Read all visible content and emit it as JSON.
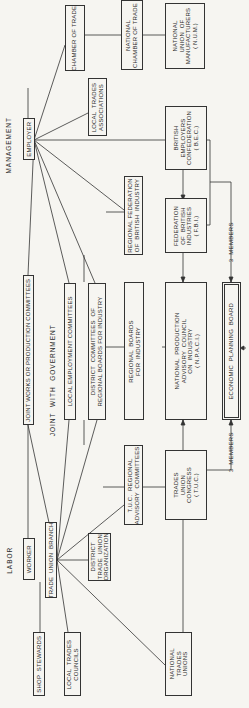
{
  "headings": {
    "management": "MANAGEMENT",
    "labor": "LABOR",
    "joint_with_government": "JOINT  WITH  GOVERNMENT"
  },
  "boxes": {
    "chamber_of_trade": "CHAMBER OF TRADE",
    "national_chamber_of_trade": "NATIONAL\nCHAMBER OF TRADE",
    "num": "NATIONAL\nUNION  OF\nMANUFACTURERS\n( N.U.M.)",
    "local_trades_associations": "LOCAL  TRADES\nASSOCIATIONS",
    "employer": "EMPLOYER",
    "bec": "BRITISH\nEMPLOYERS\nCONFEDERATION\n( B.E.C.)",
    "regional_federation": "REGIONAL FEDERATION\nOF  BRITISH  INDUSTRY",
    "fbi": "FEDERATION\nOF  BRITISH\nINDUSTRIES\n( F.B.I.)",
    "joint_works": "JOINT WORKS OR PRODUCTION COMMITTEES",
    "local_employment": "LOCAL EMPLOYMENT COMMITTEES",
    "district_committees": "DISTRICT  COMMITTEES  OF\nREGIONAL BOARDS FOR INDUSTRY",
    "regional_boards": "REGIONAL  BOARDS\nFOR  INDUSTRY",
    "npaci": "NATIONAL  PRODUCTION\nADVISORY  COUNCIL\nON  INDUSTRY\n( N.P.A.C.I.)",
    "economic_planning_board": "ECONOMIC  PLANNING  BOARD",
    "tuc_regional": "T.U.C.  REGIONAL\nADVISORY  COMMITTEES",
    "tuc": "TRADES\nUNION\nCONGRESS\n( T.U.C.)",
    "worker": "WORKER",
    "trade_union_branch": "TRADE  UNION  BRANCH",
    "district_tu_org": "DISTRICT\nTRADE  UNION\nORGANIZATION",
    "shop_stewards": "SHOP  STEWARDS",
    "local_trades_councils": "LOCAL  TRADES\nCOUNCILS",
    "national_trades_unions": "NATIONAL\nTRADES\nUNIONS"
  },
  "edge_labels": {
    "members_upper": "3  MEMBERS",
    "members_lower": "3  MEMBERS"
  }
}
